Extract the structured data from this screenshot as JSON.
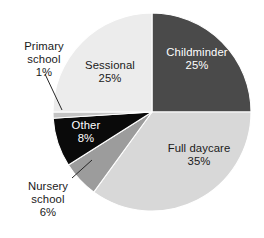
{
  "chart_data": {
    "type": "pie",
    "title": "",
    "subtitle": "",
    "xlabel": "",
    "ylabel": "",
    "legend_position": "none",
    "grid": false,
    "units": "%",
    "categories": [
      "Childminder",
      "Full daycare",
      "Nursery school",
      "Other",
      "Primary school",
      "Sessional"
    ],
    "values": [
      25,
      35,
      6,
      8,
      1,
      25
    ],
    "slices": [
      {
        "label": "Childminder",
        "value": 25,
        "value_text": "25%",
        "color": "#4a4a4a",
        "text_color": "#ffffff",
        "label_placement": "inside",
        "start_angle_deg": 0,
        "end_angle_deg": 90
      },
      {
        "label": "Full daycare",
        "value": 35,
        "value_text": "35%",
        "color": "#d8d8d8",
        "text_color": "#1a1a1a",
        "label_placement": "inside",
        "start_angle_deg": 90,
        "end_angle_deg": 216
      },
      {
        "label": "Nursery school",
        "value": 6,
        "value_text": "6%",
        "color": "#9c9c9c",
        "text_color": "#1a1a1a",
        "label_placement": "outside",
        "start_angle_deg": 216,
        "end_angle_deg": 237.6
      },
      {
        "label": "Other",
        "value": 8,
        "value_text": "8%",
        "color": "#0a0a0a",
        "text_color": "#ffffff",
        "label_placement": "inside",
        "start_angle_deg": 237.6,
        "end_angle_deg": 266.4
      },
      {
        "label": "Primary school",
        "value": 1,
        "value_text": "1%",
        "color": "#c4c4c4",
        "text_color": "#1a1a1a",
        "label_placement": "outside",
        "start_angle_deg": 266.4,
        "end_angle_deg": 270
      },
      {
        "label": "Sessional",
        "value": 25,
        "value_text": "25%",
        "color": "#ececec",
        "text_color": "#1a1a1a",
        "label_placement": "inside",
        "start_angle_deg": 270,
        "end_angle_deg": 360
      }
    ]
  },
  "labels": {
    "childminder": {
      "name": "Childminder",
      "value": "25%"
    },
    "full_daycare": {
      "name": "Full daycare",
      "value": "35%"
    },
    "sessional": {
      "name": "Sessional",
      "value": "25%"
    },
    "other": {
      "name": "Other",
      "value": "8%"
    },
    "primary_school": {
      "name_line1": "Primary",
      "name_line2": "school",
      "value": "1%"
    },
    "nursery_school": {
      "name_line1": "Nursery",
      "name_line2": "school",
      "value": "6%"
    }
  },
  "geometry": {
    "center_x": 152,
    "center_y": 112,
    "radius": 99
  }
}
